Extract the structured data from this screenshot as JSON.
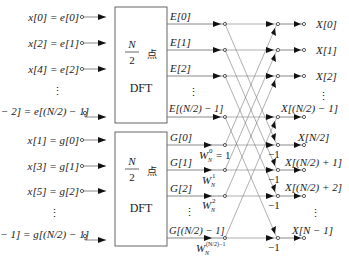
{
  "figure": {
    "type": "radix-2 decimation-in-time FFT flow graph",
    "inputs_even": [
      {
        "label": "x[0] = e[0]",
        "y": 17
      },
      {
        "label": "x[2] = e[1]",
        "y": 43
      },
      {
        "label": "x[4] = e[2]",
        "y": 69
      },
      {
        "label": "⋮",
        "y": 90
      },
      {
        "label": "x[N − 2] = e[(N/2) − 1]",
        "y": 112
      }
    ],
    "inputs_odd": [
      {
        "label": "x[1] = g[0]",
        "y": 140
      },
      {
        "label": "x[3] = g[1]",
        "y": 166
      },
      {
        "label": "x[5] = g[2]",
        "y": 191
      },
      {
        "label": "⋮",
        "y": 212
      },
      {
        "label": "x[N − 1] = g[(N/2) − 1]",
        "y": 235
      }
    ],
    "dft_block_top": {
      "num": "N",
      "den": "2",
      "point": "点",
      "name": "DFT"
    },
    "dft_block_bottom": {
      "num": "N",
      "den": "2",
      "point": "点",
      "name": "DFT"
    },
    "even_outputs": [
      "E[0]",
      "E[1]",
      "E[2]",
      "⋮",
      "E[(N/2) − 1]"
    ],
    "odd_outputs": [
      "G[0]",
      "G[1]",
      "G[2]",
      "⋮",
      "G[(N/2) − 1]"
    ],
    "twiddles": [
      "W_N^0 = 1",
      "W_N^1",
      "W_N^2",
      "W_N^((N/2)−1)"
    ],
    "twiddle_parts": {
      "w": "W",
      "n": "N",
      "e0": "0",
      "eq1": "= 1",
      "e1": "1",
      "e2": "2",
      "elast": "(N/2)−1"
    },
    "minus_one": "−1",
    "outputs": [
      {
        "label": "X[0]",
        "y": 17
      },
      {
        "label": "X[1]",
        "y": 43
      },
      {
        "label": "X[2]",
        "y": 69
      },
      {
        "label": "⋮",
        "y": 90
      },
      {
        "label": "X[(N/2) − 1]",
        "y": 112
      },
      {
        "label": "X[N/2]",
        "y": 140
      },
      {
        "label": "X[(N/2) + 1]",
        "y": 166
      },
      {
        "label": "X[(N/2) + 2]",
        "y": 191
      },
      {
        "label": "⋮",
        "y": 212
      },
      {
        "label": "X[N − 1]",
        "y": 235
      }
    ],
    "vdots": "⋮"
  }
}
